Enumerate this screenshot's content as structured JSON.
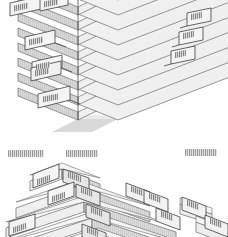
{
  "figure": {
    "type": "isometric-layer-diagram",
    "background_color": "#ffffff",
    "palette": {
      "face_top": "#f2f2f2",
      "face_left": "#d7d7d7",
      "face_right": "#ededed",
      "edge": "#555555",
      "edge_light": "#8a8a8a",
      "label_fill": "#f4f4f4",
      "label_stroke": "#4a4a4a",
      "shadow": "#cfcfcf",
      "text_gray": "#909090"
    }
  },
  "column_headers": [
    {
      "id": "header-1",
      "text": "█████████",
      "legible": false,
      "x": 8,
      "y": 150,
      "width": 36
    },
    {
      "id": "header-2",
      "text": "█████████",
      "legible": false,
      "x": 66,
      "y": 150,
      "width": 32
    },
    {
      "id": "header-3",
      "text": "█████████",
      "legible": false,
      "x": 185,
      "y": 149,
      "width": 32
    }
  ],
  "top_diagram": {
    "id": "stacked-slab-stack",
    "description": "Vertical stack of isometric slabs seen from the front-left corner, clipped at top of frame",
    "layer_count": 9,
    "slab_depth_px": 8,
    "layer_pitch_px": 15,
    "has_ground_shadow": true,
    "left_callouts": [
      {
        "index": 0,
        "x": 10,
        "y": 2,
        "w": 30,
        "h": 13,
        "label": "████",
        "legible": false
      },
      {
        "index": 1,
        "x": 38,
        "y": 0,
        "w": 30,
        "h": 13,
        "label": "████",
        "legible": false
      },
      {
        "index": 2,
        "x": 24,
        "y": 36,
        "w": 30,
        "h": 13,
        "label": "████",
        "legible": false
      },
      {
        "index": 3,
        "x": 30,
        "y": 60,
        "w": 30,
        "h": 13,
        "label": "████",
        "legible": false
      },
      {
        "index": 4,
        "x": 30,
        "y": 66,
        "w": 30,
        "h": 13,
        "label": "████",
        "legible": false
      },
      {
        "index": 5,
        "x": 38,
        "y": 92,
        "w": 30,
        "h": 13,
        "label": "████",
        "legible": false
      }
    ],
    "right_callouts": [
      {
        "index": 0,
        "x": 186,
        "y": 12,
        "w": 26,
        "h": 12,
        "label": "███",
        "legible": false
      },
      {
        "index": 1,
        "x": 178,
        "y": 31,
        "w": 26,
        "h": 12,
        "label": "███",
        "legible": false
      },
      {
        "index": 2,
        "x": 170,
        "y": 50,
        "w": 26,
        "h": 12,
        "label": "███",
        "legible": false
      }
    ]
  },
  "bottom_diagram": {
    "id": "exploded-corner-stack",
    "description": "Exploded isometric corner panels fanning down-right, clipped at bottom of frame",
    "layer_count": 6,
    "callouts": [
      {
        "index": 0,
        "x": 33,
        "y": 173,
        "w": 26,
        "h": 12,
        "label": "███",
        "legible": false
      },
      {
        "index": 1,
        "x": 62,
        "y": 168,
        "w": 26,
        "h": 12,
        "label": "███",
        "legible": false
      },
      {
        "index": 2,
        "x": 48,
        "y": 190,
        "w": 26,
        "h": 12,
        "label": "███",
        "legible": false
      },
      {
        "index": 3,
        "x": 125,
        "y": 182,
        "w": 26,
        "h": 12,
        "label": "███",
        "legible": false
      },
      {
        "index": 4,
        "x": 143,
        "y": 189,
        "w": 26,
        "h": 12,
        "label": "███",
        "legible": false
      },
      {
        "index": 5,
        "x": 74,
        "y": 200,
        "w": 26,
        "h": 12,
        "label": "███",
        "legible": false
      },
      {
        "index": 6,
        "x": 155,
        "y": 207,
        "w": 26,
        "h": 12,
        "label": "███",
        "legible": false
      },
      {
        "index": 7,
        "x": 181,
        "y": 196,
        "w": 26,
        "h": 12,
        "label": "███",
        "legible": false
      },
      {
        "index": 8,
        "x": 204,
        "y": 214,
        "w": 24,
        "h": 12,
        "label": "███",
        "legible": false
      },
      {
        "index": 9,
        "x": 9,
        "y": 222,
        "w": 26,
        "h": 12,
        "label": "███",
        "legible": false
      },
      {
        "index": 10,
        "x": 81,
        "y": 224,
        "w": 26,
        "h": 12,
        "label": "███",
        "legible": false
      }
    ]
  }
}
